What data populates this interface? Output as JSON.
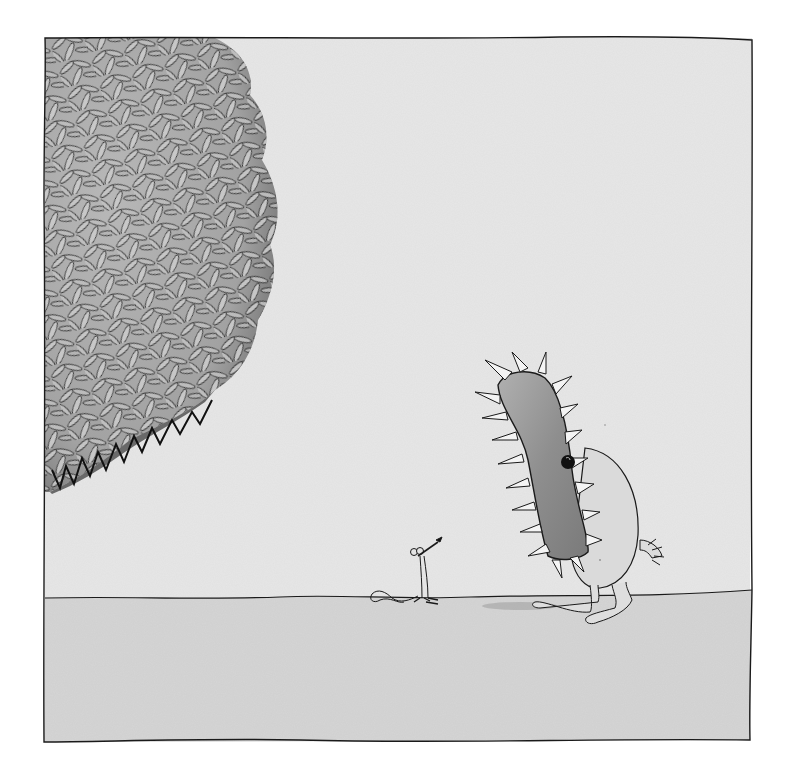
{
  "illustration": {
    "style": "ink and grey watercolor wash",
    "colors": {
      "page_background": "#ffffff",
      "sky_wash": "#e6e6e6",
      "ground_wash": "#d6d6d6",
      "ink": "#1a1a1a",
      "bush_shadow": "#8a8a8a",
      "bush_leaf": "#c4c4c4",
      "monster_mouth": "#9a9a9a",
      "monster_body": "#dcdcdc",
      "tooth": "#f4f4f4"
    },
    "elements": [
      {
        "id": "frame",
        "label": "Hand-drawn rectangular frame border"
      },
      {
        "id": "bush",
        "label": "Dense leafy bush at top-left"
      },
      {
        "id": "monster",
        "label": "Large creature with tall spiky open mouth"
      },
      {
        "id": "mouse",
        "label": "Tiny mouse standing on ground looking up"
      },
      {
        "id": "ground",
        "label": "Grey ground plane"
      }
    ]
  }
}
